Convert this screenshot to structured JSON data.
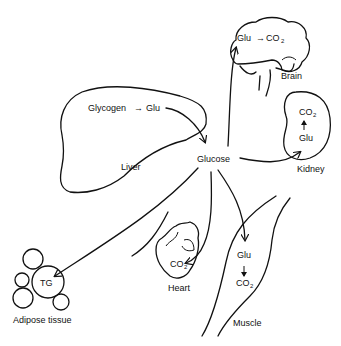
{
  "diagram": {
    "center": {
      "label": "Glucose"
    },
    "organs": {
      "brain": {
        "label": "Brain",
        "reaction": {
          "from": "Glu",
          "to": "CO",
          "to_sub": "2"
        }
      },
      "liver": {
        "label": "Liver",
        "reaction": {
          "from": "Glycogen",
          "to": "Glu"
        }
      },
      "kidney": {
        "label": "Kidney",
        "reaction": {
          "from": "Glu",
          "to": "CO",
          "to_sub": "2"
        }
      },
      "heart": {
        "label": "Heart",
        "product": {
          "text": "CO",
          "sub": "2"
        }
      },
      "muscle": {
        "label": "Muscle",
        "reaction": {
          "from": "Glu",
          "to": "CO",
          "to_sub": "2"
        }
      },
      "adipose": {
        "label": "Adipose tissue",
        "product": {
          "text": "TG"
        }
      }
    },
    "arrows": [
      {
        "from": "Liver Glu",
        "to": "Glucose"
      },
      {
        "from": "Glucose",
        "to": "Brain"
      },
      {
        "from": "Glucose",
        "to": "Kidney"
      },
      {
        "from": "Glucose",
        "to": "Heart"
      },
      {
        "from": "Glucose",
        "to": "Muscle"
      },
      {
        "from": "Glucose",
        "to": "Adipose tissue"
      }
    ],
    "colors": {
      "ink": "#111111",
      "background": "#ffffff"
    }
  }
}
